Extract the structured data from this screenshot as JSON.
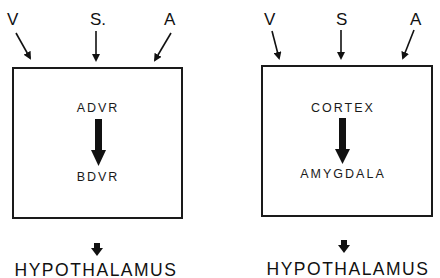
{
  "panels": [
    {
      "inputs": [
        "V",
        "S.",
        "A"
      ],
      "source": "ADVR",
      "target": "BDVR",
      "output": "HYPOTHALAMUS"
    },
    {
      "inputs": [
        "V",
        "S",
        "A"
      ],
      "source": "CORTEX",
      "target": "AMYGDALA",
      "output": "HYPOTHALAMUS"
    }
  ],
  "colors": {
    "ink": "#111111",
    "background": "#ffffff"
  }
}
